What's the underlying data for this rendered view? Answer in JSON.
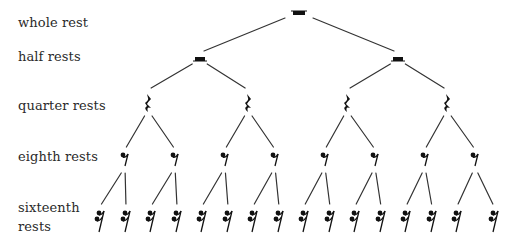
{
  "colors": {
    "ink": "#111111",
    "line": "#333333",
    "text": "#2a2a2a",
    "background": "#ffffff"
  },
  "labels": [
    {
      "id": "whole",
      "text": "whole rest",
      "top": 14
    },
    {
      "id": "half",
      "text": "half rests",
      "top": 48
    },
    {
      "id": "quarter",
      "text": "quarter rests",
      "top": 97
    },
    {
      "id": "eighth",
      "text": "eighth rests",
      "top": 148
    },
    {
      "id": "sixteenth_1",
      "text": "sixteenth",
      "top": 199
    },
    {
      "id": "sixteenth_2",
      "text": "rests",
      "top": 218
    }
  ],
  "tree": {
    "levels": [
      {
        "name": "whole",
        "symbol": "whole-rest",
        "y": 13,
        "xs": [
          299
        ]
      },
      {
        "name": "half",
        "symbol": "half-rest",
        "y": 59,
        "xs": [
          200,
          398
        ]
      },
      {
        "name": "quarter",
        "symbol": "quarter-rest",
        "y": 103,
        "xs": [
          148,
          248,
          347,
          447
        ]
      },
      {
        "name": "eighth",
        "symbol": "eighth-rest",
        "y": 159,
        "xs": [
          125,
          175,
          225,
          275,
          325,
          375,
          425,
          475
        ]
      },
      {
        "name": "sixteenth",
        "symbol": "sixteenth-rest",
        "y": 221,
        "xs": [
          100,
          126,
          151,
          177,
          202,
          228,
          253,
          279,
          304,
          330,
          355,
          381,
          406,
          432,
          457,
          494
        ]
      }
    ],
    "edges": {
      "whole_half": {
        "parent_gap_y": 18,
        "child_gap_y": 51
      },
      "half_quarter": {
        "parent_gap_y": 64,
        "child_gap_y": 88
      },
      "quarter_eighth": {
        "parent_gap_y": 116,
        "child_gap_y": 147
      },
      "eighth_sixteenth": {
        "parent_gap_y": 173,
        "child_gap_y": 204
      }
    }
  }
}
